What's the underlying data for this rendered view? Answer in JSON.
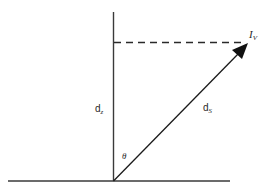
{
  "diagram": {
    "type": "geometry-vector-diagram",
    "colors": {
      "line": "#2a2a2a",
      "background": "#ffffff"
    },
    "labels": {
      "vertical_distance": {
        "main": "d",
        "sub": "z"
      },
      "slant_distance": {
        "main": "d",
        "sub": "S"
      },
      "angle": "θ",
      "target_point": {
        "main": "I",
        "sub": "V"
      }
    },
    "elements": {
      "ground_line": "horizontal baseline",
      "vertical_axis": "vertical line from origin",
      "projection_line": "dashed horizontal line at target height",
      "slant_vector": "arrow from origin to target point"
    }
  }
}
